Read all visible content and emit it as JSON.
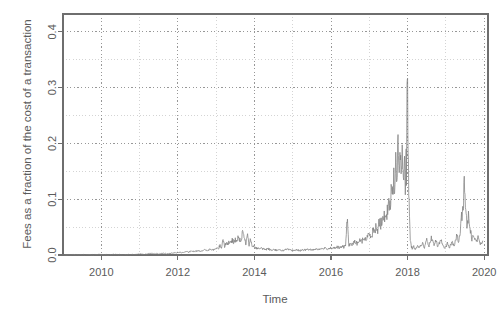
{
  "figure": {
    "background": "#ffffff",
    "plot_area": {
      "left": 63,
      "top": 14,
      "right": 488,
      "bottom": 255
    },
    "frame_color": "#6e6e6e",
    "grid_major_color": "#8c8c8c",
    "grid_minor_color": "#c9c9c9",
    "line_color": "#808080"
  },
  "chart_data": {
    "type": "line",
    "title": "",
    "xlabel": "Time",
    "ylabel": "Fees as a fraction of the cost of a transaction",
    "xlim": [
      2009.0,
      2020.1
    ],
    "ylim": [
      0.0,
      0.432
    ],
    "grid": true,
    "legend": "none",
    "xticks": [
      2010,
      2012,
      2014,
      2016,
      2018,
      2020
    ],
    "xticklabels": [
      "2010",
      "2012",
      "2014",
      "2016",
      "2018",
      "2020"
    ],
    "xticks_minor": [
      2009,
      2011,
      2013,
      2015,
      2017,
      2019
    ],
    "yticks": [
      0.0,
      0.1,
      0.2,
      0.3,
      0.4
    ],
    "yticklabels": [
      "0.0",
      "0.1",
      "0.2",
      "0.3",
      "0.4"
    ],
    "yticks_minor": [
      0.05,
      0.15,
      0.25,
      0.35
    ],
    "series": [
      {
        "name": "fee_fraction",
        "x": [
          2009.05,
          2009.18,
          2009.32,
          2009.46,
          2009.6,
          2009.74,
          2009.88,
          2010.02,
          2010.16,
          2010.3,
          2010.44,
          2010.58,
          2010.72,
          2010.86,
          2011.0,
          2011.12,
          2011.24,
          2011.36,
          2011.48,
          2011.6,
          2011.72,
          2011.84,
          2011.96,
          2012.04,
          2012.12,
          2012.2,
          2012.28,
          2012.36,
          2012.44,
          2012.52,
          2012.6,
          2012.68,
          2012.76,
          2012.84,
          2012.92,
          2013.0,
          2013.06,
          2013.1,
          2013.14,
          2013.18,
          2013.22,
          2013.26,
          2013.3,
          2013.34,
          2013.38,
          2013.42,
          2013.46,
          2013.5,
          2013.54,
          2013.58,
          2013.62,
          2013.66,
          2013.7,
          2013.74,
          2013.78,
          2013.82,
          2013.86,
          2013.9,
          2013.94,
          2013.98,
          2014.04,
          2014.12,
          2014.2,
          2014.28,
          2014.36,
          2014.44,
          2014.52,
          2014.6,
          2014.68,
          2014.76,
          2014.84,
          2014.92,
          2015.0,
          2015.1,
          2015.2,
          2015.3,
          2015.4,
          2015.5,
          2015.6,
          2015.7,
          2015.8,
          2015.9,
          2016.0,
          2016.08,
          2016.16,
          2016.24,
          2016.3,
          2016.34,
          2016.38,
          2016.42,
          2016.46,
          2016.5,
          2016.56,
          2016.62,
          2016.68,
          2016.74,
          2016.8,
          2016.86,
          2016.92,
          2016.97,
          2017.02,
          2017.06,
          2017.1,
          2017.14,
          2017.18,
          2017.22,
          2017.26,
          2017.3,
          2017.34,
          2017.38,
          2017.42,
          2017.46,
          2017.5,
          2017.54,
          2017.57,
          2017.6,
          2017.63,
          2017.66,
          2017.69,
          2017.72,
          2017.75,
          2017.78,
          2017.81,
          2017.84,
          2017.86,
          2017.88,
          2017.9,
          2017.92,
          2017.94,
          2017.955,
          2017.97,
          2017.985,
          2018.0,
          2018.015,
          2018.03,
          2018.05,
          2018.07,
          2018.09,
          2018.12,
          2018.16,
          2018.2,
          2018.26,
          2018.32,
          2018.38,
          2018.44,
          2018.5,
          2018.56,
          2018.62,
          2018.68,
          2018.74,
          2018.8,
          2018.86,
          2018.92,
          2018.98,
          2019.04,
          2019.1,
          2019.16,
          2019.22,
          2019.28,
          2019.34,
          2019.4,
          2019.44,
          2019.48,
          2019.52,
          2019.56,
          2019.6,
          2019.64,
          2019.68,
          2019.72,
          2019.78,
          2019.84,
          2019.9,
          2019.96
        ],
        "y": [
          0.0,
          0.0,
          0.001,
          0.0,
          0.001,
          0.0,
          0.001,
          0.001,
          0.0,
          0.001,
          0.001,
          0.0,
          0.001,
          0.001,
          0.002,
          0.001,
          0.002,
          0.003,
          0.002,
          0.003,
          0.002,
          0.003,
          0.004,
          0.005,
          0.004,
          0.006,
          0.005,
          0.007,
          0.006,
          0.008,
          0.007,
          0.009,
          0.008,
          0.01,
          0.009,
          0.012,
          0.011,
          0.018,
          0.013,
          0.03,
          0.016,
          0.022,
          0.019,
          0.024,
          0.021,
          0.026,
          0.023,
          0.029,
          0.025,
          0.031,
          0.027,
          0.024,
          0.047,
          0.026,
          0.021,
          0.044,
          0.019,
          0.03,
          0.017,
          0.015,
          0.013,
          0.011,
          0.012,
          0.01,
          0.011,
          0.009,
          0.01,
          0.008,
          0.009,
          0.008,
          0.01,
          0.009,
          0.008,
          0.009,
          0.008,
          0.009,
          0.01,
          0.009,
          0.011,
          0.01,
          0.012,
          0.011,
          0.013,
          0.012,
          0.014,
          0.013,
          0.015,
          0.014,
          0.016,
          0.07,
          0.018,
          0.02,
          0.019,
          0.023,
          0.021,
          0.026,
          0.024,
          0.03,
          0.028,
          0.034,
          0.038,
          0.034,
          0.045,
          0.04,
          0.052,
          0.046,
          0.06,
          0.054,
          0.068,
          0.062,
          0.08,
          0.07,
          0.095,
          0.085,
          0.12,
          0.1,
          0.145,
          0.115,
          0.17,
          0.13,
          0.21,
          0.15,
          0.175,
          0.13,
          0.205,
          0.14,
          0.12,
          0.19,
          0.13,
          0.175,
          0.15,
          0.33,
          0.27,
          0.195,
          0.125,
          0.06,
          0.03,
          0.018,
          0.012,
          0.015,
          0.011,
          0.018,
          0.013,
          0.022,
          0.014,
          0.026,
          0.016,
          0.03,
          0.018,
          0.024,
          0.015,
          0.028,
          0.017,
          0.013,
          0.02,
          0.014,
          0.024,
          0.016,
          0.035,
          0.022,
          0.06,
          0.085,
          0.12,
          0.08,
          0.05,
          0.075,
          0.045,
          0.03,
          0.038,
          0.024,
          0.03,
          0.02,
          0.025
        ]
      }
    ]
  }
}
